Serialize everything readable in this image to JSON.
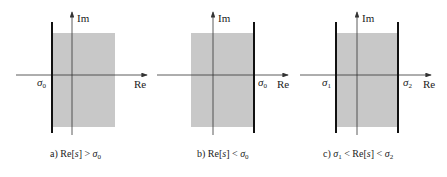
{
  "axis_labels": {
    "real": "Re",
    "imag": "Im"
  },
  "panels": [
    {
      "id": "a",
      "caption": {
        "prefix": "a) Re[",
        "var": "s",
        "mid": "] > ",
        "sym": "σ",
        "sub": "0",
        "tail": ""
      },
      "boundary_labels": [
        {
          "sym": "σ",
          "sub": "0"
        }
      ],
      "region": "right-of-sigma0",
      "description": "Re[s] > σ0"
    },
    {
      "id": "b",
      "caption": {
        "prefix": "b) Re[",
        "var": "s",
        "mid": "] < ",
        "sym": "σ",
        "sub": "0",
        "tail": ""
      },
      "boundary_labels": [
        {
          "sym": "σ",
          "sub": "0"
        }
      ],
      "region": "left-of-sigma0",
      "description": "Re[s] < σ0"
    },
    {
      "id": "c",
      "caption": {
        "prefix": "c) ",
        "sym1": "σ",
        "sub1": "1",
        "mid1": " < Re[",
        "var": "s",
        "mid2": "] < ",
        "sym2": "σ",
        "sub2": "2"
      },
      "boundary_labels": [
        {
          "sym": "σ",
          "sub": "1"
        },
        {
          "sym": "σ",
          "sub": "2"
        }
      ],
      "region": "strip-sigma1-sigma2",
      "description": "σ1 < Re[s] < σ2"
    }
  ],
  "colors": {
    "region_fill": "#c8c8c8",
    "axis": "#333333",
    "boundary": "#111111"
  }
}
